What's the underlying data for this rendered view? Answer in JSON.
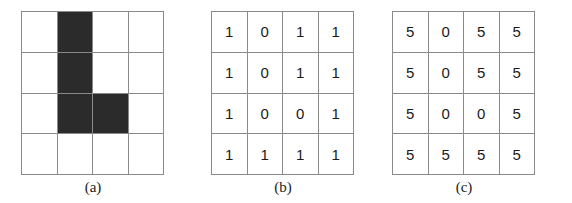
{
  "figure": {
    "grid_rows": 4,
    "grid_cols": 4,
    "colors": {
      "fill": "#2b2b2b",
      "empty": "#ffffff",
      "gridline": "#8a8a8a",
      "text": "#1b1b1b"
    },
    "panels": [
      {
        "id": "a",
        "caption": "(a)",
        "kind": "shape",
        "cells": [
          [
            "empty",
            "filled",
            "empty",
            "empty"
          ],
          [
            "empty",
            "filled",
            "empty",
            "empty"
          ],
          [
            "empty",
            "filled",
            "filled",
            "empty"
          ],
          [
            "empty",
            "empty",
            "empty",
            "empty"
          ]
        ]
      },
      {
        "id": "b",
        "caption": "(b)",
        "kind": "values",
        "values": [
          [
            "1",
            "0",
            "1",
            "1"
          ],
          [
            "1",
            "0",
            "1",
            "1"
          ],
          [
            "1",
            "0",
            "0",
            "1"
          ],
          [
            "1",
            "1",
            "1",
            "1"
          ]
        ]
      },
      {
        "id": "c",
        "caption": "(c)",
        "kind": "values",
        "values": [
          [
            "5",
            "0",
            "5",
            "5"
          ],
          [
            "5",
            "0",
            "5",
            "5"
          ],
          [
            "5",
            "0",
            "0",
            "5"
          ],
          [
            "5",
            "5",
            "5",
            "5"
          ]
        ]
      }
    ]
  }
}
